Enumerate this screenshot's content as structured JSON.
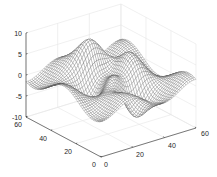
{
  "chart_data": {
    "type": "surface-mesh",
    "title": "",
    "xlabel": "",
    "ylabel": "",
    "zlabel": "",
    "xlim": [
      0,
      60
    ],
    "ylim": [
      0,
      60
    ],
    "zlim": [
      -10,
      10
    ],
    "xticks": [
      "0",
      "20",
      "40",
      "60"
    ],
    "yticks": [
      "0",
      "20",
      "40",
      "60"
    ],
    "zticks": [
      "-10",
      "-5",
      "0",
      "5",
      "10"
    ],
    "grid": true,
    "grid_size": [
      49,
      49
    ],
    "function": "peaks-like wavy surface (z range approx -8 to 8)",
    "mesh_color": "#4d4d4d",
    "face_color": "#ffffff",
    "grid_color": "#e6e6e6",
    "axis_color": "#262626",
    "legend": []
  }
}
